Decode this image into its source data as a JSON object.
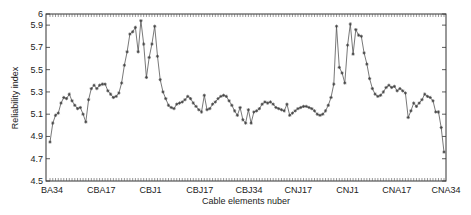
{
  "chart_data": {
    "type": "line",
    "title": "",
    "xlabel": "Cable elements nuber",
    "ylabel": "Reliability index",
    "ylim": [
      4.5,
      6.0
    ],
    "yticks": [
      4.5,
      4.7,
      4.9,
      5.1,
      5.3,
      5.5,
      5.7,
      5.9,
      6.0
    ],
    "ytick_labels": [
      "4.5",
      "4.7",
      "4.9",
      "5.1",
      "5.3",
      "5.5",
      "5.7",
      "5.9",
      "6"
    ],
    "xtick_labels": [
      "BA34",
      "CBA17",
      "CBJ1",
      "CBJ17",
      "CBJ34",
      "CNJ17",
      "CNJ1",
      "CNA17",
      "CNA34"
    ],
    "grid": false,
    "legend": null,
    "marker": "asterisk",
    "line_color": "#555555",
    "series": [
      {
        "name": "Reliability index",
        "values": [
          4.85,
          5.02,
          5.09,
          5.11,
          5.2,
          5.25,
          5.24,
          5.28,
          5.22,
          5.18,
          5.15,
          5.16,
          5.1,
          5.03,
          5.23,
          5.33,
          5.36,
          5.33,
          5.36,
          5.37,
          5.37,
          5.31,
          5.28,
          5.25,
          5.26,
          5.29,
          5.38,
          5.54,
          5.66,
          5.82,
          5.84,
          5.88,
          5.66,
          5.94,
          5.73,
          5.43,
          5.61,
          5.73,
          5.89,
          5.62,
          5.41,
          5.3,
          5.24,
          5.18,
          5.16,
          5.15,
          5.19,
          5.2,
          5.21,
          5.23,
          5.26,
          5.24,
          5.2,
          5.17,
          5.14,
          5.12,
          5.27,
          5.14,
          5.15,
          5.19,
          5.21,
          5.24,
          5.26,
          5.27,
          5.26,
          5.22,
          5.18,
          5.13,
          5.09,
          5.16,
          5.05,
          5.02,
          5.14,
          5.02,
          5.12,
          5.13,
          5.15,
          5.19,
          5.21,
          5.2,
          5.21,
          5.19,
          5.16,
          5.15,
          5.14,
          5.13,
          5.19,
          5.09,
          5.11,
          5.13,
          5.15,
          5.16,
          5.17,
          5.17,
          5.16,
          5.15,
          5.13,
          5.1,
          5.09,
          5.1,
          5.13,
          5.18,
          5.25,
          5.37,
          5.89,
          5.52,
          5.47,
          5.38,
          5.72,
          5.91,
          5.64,
          5.86,
          5.81,
          5.8,
          5.65,
          5.55,
          5.42,
          5.33,
          5.28,
          5.26,
          5.27,
          5.3,
          5.34,
          5.36,
          5.34,
          5.35,
          5.31,
          5.33,
          5.31,
          5.29,
          5.07,
          5.13,
          5.2,
          5.17,
          5.2,
          5.23,
          5.28,
          5.26,
          5.25,
          5.22,
          5.12,
          5.12,
          4.98,
          4.76
        ]
      }
    ]
  }
}
